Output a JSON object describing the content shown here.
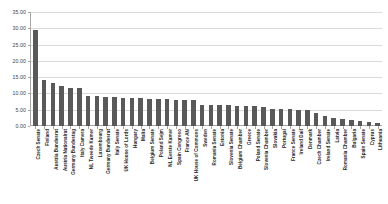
{
  "chart_data": {
    "type": "bar",
    "title": "",
    "subtitle": "",
    "xlabel": "",
    "ylabel": "",
    "ylim": [
      0,
      35
    ],
    "ytick_step": 5,
    "grid": true,
    "legend": false,
    "bar_color": "#595959",
    "gridline_color": "#d9d9d9",
    "axis_color": "#a6a6a6",
    "ytick_labels": [
      "0.00",
      "5.00",
      "10.00",
      "15.00",
      "20.00",
      "25.00",
      "30.00",
      "35.00"
    ],
    "ytick_values": [
      0,
      5,
      10,
      15,
      20,
      25,
      30,
      35
    ],
    "categories": [
      "Czech Senate",
      "Finland",
      "Austria Bundesrat",
      "Austria Nationalrat",
      "Germany Bundestag",
      "Italy Camera",
      "NL Tweede Kamer",
      "Luxembourg",
      "Germany Bundesrat",
      "Italy Senate",
      "UK House of Lords",
      "Hungary",
      "Malta",
      "Belgium Senate",
      "Poland Sejm",
      "NL Eerste Kamer",
      "Spain Congreso",
      "France AN",
      "UK House of Commons",
      "Sweden",
      "Romania Senate",
      "Estonia",
      "Slovenia Senate",
      "Belgium Chamber",
      "Greece",
      "Poland Senate",
      "Slovenia Chamber",
      "Slovakia",
      "Portugal",
      "France Senate",
      "Ireland Dail",
      "Denmark",
      "Czech Chamber",
      "Ireland Senate",
      "Latvia",
      "Romania Chamber",
      "Bulgaria",
      "Spain Senate",
      "Cyprus",
      "Lithuania"
    ],
    "values": [
      29.4,
      14.1,
      13.2,
      12.3,
      11.8,
      11.7,
      9.3,
      9.1,
      8.9,
      8.8,
      8.7,
      8.6,
      8.5,
      8.4,
      8.3,
      8.2,
      8.1,
      8.0,
      7.9,
      6.6,
      6.5,
      6.4,
      6.3,
      6.2,
      6.1,
      6.0,
      5.9,
      5.3,
      5.2,
      5.1,
      5.0,
      4.8,
      4.1,
      3.2,
      2.6,
      2.2,
      1.8,
      1.5,
      1.2,
      0.9
    ]
  }
}
